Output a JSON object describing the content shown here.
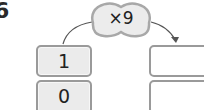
{
  "question": {
    "number": "6"
  },
  "operation": {
    "label": "×9",
    "shape": "peanut-bubble"
  },
  "input_column": {
    "boxes": [
      {
        "value": "1"
      },
      {
        "value": "0"
      }
    ]
  },
  "output_column": {
    "boxes": [
      {
        "value": ""
      },
      {
        "value": ""
      }
    ]
  },
  "colors": {
    "box_fill": "#ebebeb",
    "box_border": "#9a9a9a",
    "bubble_fill": "#ececec",
    "bubble_border": "#a8a8a8",
    "arrow": "#555555",
    "text": "#222222"
  }
}
